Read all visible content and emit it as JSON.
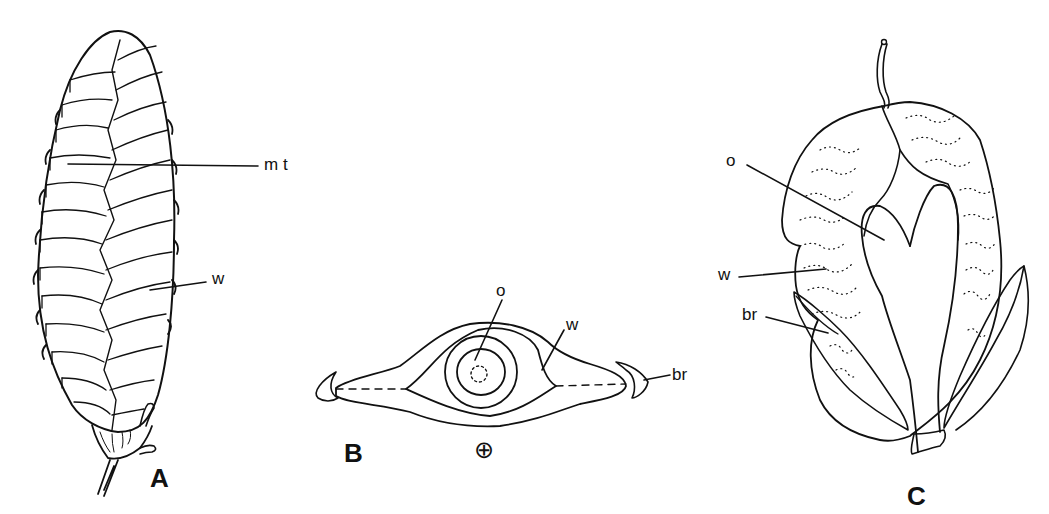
{
  "figure": {
    "panels": [
      {
        "id": "A",
        "label": "A",
        "description": "Winged fruit cone (side view)",
        "annotations": [
          {
            "key": "mt",
            "text": "m t"
          },
          {
            "key": "w",
            "text": "w"
          }
        ]
      },
      {
        "id": "B",
        "label": "B",
        "description": "Transverse section of fruit",
        "symbol": "⊕",
        "annotations": [
          {
            "key": "o",
            "text": "o"
          },
          {
            "key": "w",
            "text": "w"
          },
          {
            "key": "br",
            "text": "br"
          }
        ]
      },
      {
        "id": "C",
        "label": "C",
        "description": "Single winged fruit with bracts",
        "annotations": [
          {
            "key": "o",
            "text": "o"
          },
          {
            "key": "w",
            "text": "w"
          },
          {
            "key": "br",
            "text": "br"
          }
        ]
      }
    ]
  }
}
